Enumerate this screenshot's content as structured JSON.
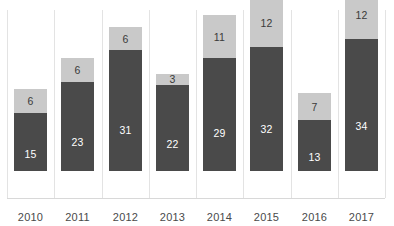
{
  "chart_data": {
    "type": "bar",
    "subtype": "stacked-vertical",
    "title": "",
    "subtitle": "",
    "xlabel": "",
    "ylabel": "",
    "categories": [
      "2010",
      "2011",
      "2012",
      "2013",
      "2014",
      "2015",
      "2016",
      "2017"
    ],
    "series": [
      {
        "name": "lower-segment",
        "color": "#4a4a4a",
        "values": [
          15,
          23,
          31,
          22,
          29,
          32,
          13,
          34
        ]
      },
      {
        "name": "upper-segment",
        "color": "#c9c9c9",
        "values": [
          6,
          6,
          6,
          3,
          11,
          12,
          7,
          12
        ]
      }
    ],
    "totals": [
      21,
      29,
      37,
      25,
      40,
      44,
      20,
      46
    ],
    "ylim": [
      0,
      46
    ],
    "grid": "vertical-only",
    "legend": "none",
    "data_labels": true,
    "axis_labels_visible": true
  },
  "axis": {
    "ticks": [
      "2010",
      "2011",
      "2012",
      "2013",
      "2014",
      "2015",
      "2016",
      "2017"
    ]
  },
  "colors": {
    "lower": "#4a4a4a",
    "upper": "#c9c9c9",
    "gridline": "#e3e3e3",
    "axis": "#d8d8d8",
    "background": "#ffffff",
    "label_dark": "#3a3a3a",
    "label_light": "#ffffff"
  }
}
